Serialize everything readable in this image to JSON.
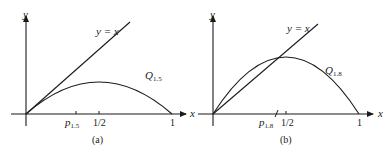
{
  "figure": {
    "panels": [
      {
        "id": "a",
        "caption": "(a)",
        "mu": 1.5,
        "axis_x_label": "x",
        "axis_y_label": "y",
        "diagonal_label": "y = x",
        "curve_label_main": "Q",
        "curve_label_sub": "1.5",
        "fixed_point_label_main": "p",
        "fixed_point_label_sub": "1.5",
        "tick_half_label": "1/2",
        "tick_one_label": "1"
      },
      {
        "id": "b",
        "caption": "(b)",
        "mu": 1.8,
        "axis_x_label": "x",
        "axis_y_label": "y",
        "diagonal_label": "y = x",
        "curve_label_main": "Q",
        "curve_label_sub": "1.8",
        "fixed_point_label_main": "p",
        "fixed_point_label_sub": "1.8",
        "tick_half_label": "1/2",
        "tick_one_label": "1"
      }
    ],
    "colors": {
      "stroke": "#1a1a1a",
      "background": "#ffffff"
    }
  }
}
